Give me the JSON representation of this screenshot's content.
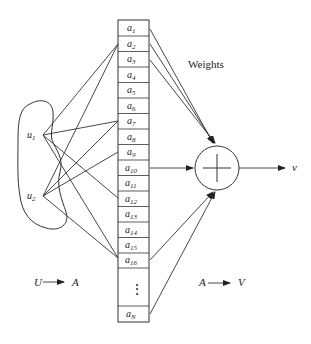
{
  "diagram": {
    "weights_label": "Weights",
    "output_label": "v",
    "inputs": [
      {
        "base": "u",
        "sub": "1"
      },
      {
        "base": "u",
        "sub": "2"
      }
    ],
    "cells": [
      {
        "base": "a",
        "sub": "1"
      },
      {
        "base": "a",
        "sub": "2"
      },
      {
        "base": "a",
        "sub": "3"
      },
      {
        "base": "a",
        "sub": "4"
      },
      {
        "base": "a",
        "sub": "5"
      },
      {
        "base": "a",
        "sub": "6"
      },
      {
        "base": "a",
        "sub": "7"
      },
      {
        "base": "a",
        "sub": "8"
      },
      {
        "base": "a",
        "sub": "9"
      },
      {
        "base": "a",
        "sub": "10"
      },
      {
        "base": "a",
        "sub": "11"
      },
      {
        "base": "a",
        "sub": "12"
      },
      {
        "base": "a",
        "sub": "13"
      },
      {
        "base": "a",
        "sub": "14"
      },
      {
        "base": "a",
        "sub": "15"
      },
      {
        "base": "a",
        "sub": "16"
      }
    ],
    "ellipsis": "⋮",
    "last_cell": {
      "base": "a",
      "sub": "N"
    },
    "mapping_left": {
      "from": "U",
      "to": "A"
    },
    "mapping_right": {
      "from": "A",
      "to": "V"
    },
    "summation_symbol": "plus-in-circle"
  }
}
